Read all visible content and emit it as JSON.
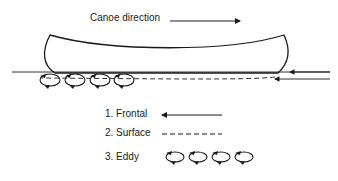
{
  "diagram": {
    "title": "Canoe direction",
    "legend": [
      {
        "number": "1.",
        "label": "Frontal",
        "style": "arrow-left"
      },
      {
        "number": "2.",
        "label": "Surface",
        "style": "dashed"
      },
      {
        "number": "3.",
        "label": "Eddy",
        "style": "loops"
      }
    ],
    "colors": {
      "line": "#1a1a1a",
      "background": "#ffffff"
    }
  },
  "labels": {
    "frontal": "1. Frontal",
    "surface": "2. Surface",
    "eddy": "3. Eddy"
  }
}
